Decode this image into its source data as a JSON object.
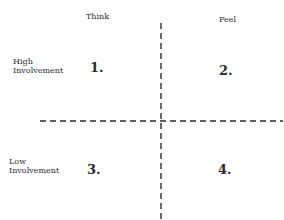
{
  "diagram": {
    "columns": [
      {
        "label": "Think"
      },
      {
        "label": "Feel"
      }
    ],
    "rows": [
      {
        "label": "High\nInvolvement"
      },
      {
        "label": "Low\nInvolvement"
      }
    ],
    "quadrants": [
      {
        "label": "1."
      },
      {
        "label": "2."
      },
      {
        "label": "3."
      },
      {
        "label": "4."
      }
    ],
    "axes": {
      "line_style": "dashed",
      "color": "#2a2a2a"
    }
  }
}
